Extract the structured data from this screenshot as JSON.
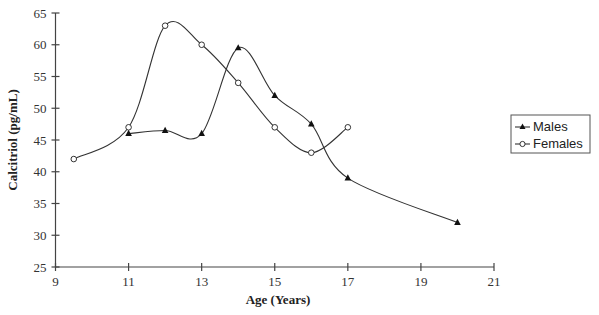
{
  "chart_data": {
    "type": "line",
    "title": "",
    "xlabel": "Age (Years)",
    "ylabel": "Calcitriol (pg/mL)",
    "xlim": [
      9,
      21
    ],
    "ylim": [
      25,
      65
    ],
    "xticks": [
      9,
      11,
      13,
      15,
      17,
      19,
      21
    ],
    "yticks": [
      25,
      30,
      35,
      40,
      45,
      50,
      55,
      60,
      65
    ],
    "grid": false,
    "legend_position": "right",
    "smooth": true,
    "series": [
      {
        "name": "Males",
        "marker": "filled-triangle",
        "x": [
          11,
          12,
          13,
          14,
          15,
          16,
          17,
          20
        ],
        "y": [
          46,
          46.5,
          46,
          59.5,
          52,
          47.5,
          39,
          32
        ]
      },
      {
        "name": "Females",
        "marker": "open-circle",
        "x": [
          9.5,
          11,
          12,
          13,
          14,
          15,
          16,
          17
        ],
        "y": [
          42,
          47,
          63,
          60,
          54,
          47,
          43,
          47
        ]
      }
    ]
  },
  "axes": {
    "x_title": "Age (Years)",
    "y_title": "Calcitriol (pg/mL)"
  },
  "legend": {
    "items": [
      {
        "label": "Males",
        "marker": "filled-triangle"
      },
      {
        "label": "Females",
        "marker": "open-circle"
      }
    ]
  },
  "colors": {
    "line": "#333333",
    "axis": "#444444",
    "background": "#ffffff"
  }
}
